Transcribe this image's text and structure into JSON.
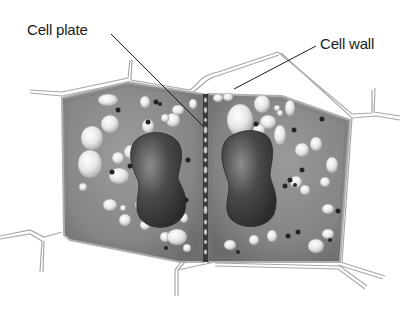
{
  "labels": {
    "cell_plate": "Cell plate",
    "cell_wall": "Cell wall"
  },
  "colors": {
    "background": "#ffffff",
    "cytoplasm": "#8a8a8a",
    "cytoplasm_dark": "#6e6e6e",
    "nucleus": "#3a3a3a",
    "vacuole": "#e8e8e8",
    "granule": "#2a2a2a",
    "wall_line": "#9a9a9a",
    "leader_line": "#1a1a1a",
    "label_text": "#1a1a1a"
  },
  "parts": [
    {
      "name": "left-daughter-cell",
      "contains": [
        "nucleus",
        "vacuoles",
        "granules"
      ]
    },
    {
      "name": "right-daughter-cell",
      "contains": [
        "nucleus",
        "vacuoles",
        "granules"
      ]
    },
    {
      "name": "cell-plate",
      "position": "between daughter cells"
    },
    {
      "name": "cell-wall",
      "position": "outer boundary"
    },
    {
      "name": "neighbor-cells",
      "position": "surrounding outlines"
    }
  ]
}
